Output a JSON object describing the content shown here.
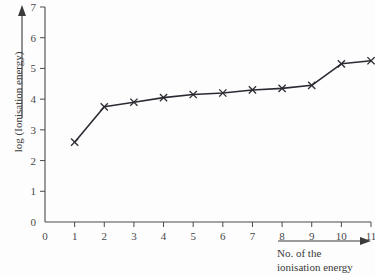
{
  "chart_data": {
    "type": "line",
    "title": "",
    "xlabel": "No. of the ionisation energy",
    "ylabel": "log (Ionisation energy)",
    "x": [
      1,
      2,
      3,
      4,
      5,
      6,
      7,
      8,
      9,
      10,
      11
    ],
    "values": [
      2.6,
      3.75,
      3.9,
      4.05,
      4.15,
      4.2,
      4.3,
      4.35,
      4.45,
      5.15,
      5.25
    ],
    "series": [
      {
        "name": "log (Ionisation energy)",
        "values": [
          2.6,
          3.75,
          3.9,
          4.05,
          4.15,
          4.2,
          4.3,
          4.35,
          4.45,
          5.15,
          5.25
        ]
      }
    ],
    "xlim": [
      0,
      11
    ],
    "ylim": [
      0,
      7
    ],
    "xticks": [
      0,
      1,
      2,
      3,
      4,
      5,
      6,
      7,
      8,
      9,
      10,
      11
    ],
    "yticks": [
      0,
      1,
      2,
      3,
      4,
      5,
      6,
      7
    ],
    "xtick_labels": [
      "0",
      "1",
      "2",
      "3",
      "4",
      "5",
      "6",
      "7",
      "8",
      "9",
      "10",
      "11"
    ],
    "ytick_labels": [
      "0",
      "1",
      "2",
      "3",
      "4",
      "5",
      "6",
      "7"
    ],
    "grid": false,
    "legend": false,
    "marker": "x",
    "line_color": "#2b2b33",
    "axis_color": "#4a4a4a",
    "background": "#fdfdfd"
  },
  "axis_titles": {
    "y": "log (Ionisation energy)",
    "x_line1": "No. of the",
    "x_line2": "ionisation energy"
  },
  "icons": {
    "y_arrow": "arrow-up-icon",
    "x_arrow": "arrow-right-icon"
  }
}
